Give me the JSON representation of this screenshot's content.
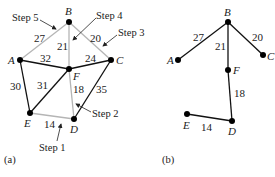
{
  "graph_a": {
    "caption": "(a)",
    "nodes": {
      "A": "A",
      "B": "B",
      "C": "C",
      "D": "D",
      "E": "E",
      "F": "F"
    },
    "edges": [
      {
        "from": "B",
        "to": "A",
        "weight": "27",
        "style": "light"
      },
      {
        "from": "B",
        "to": "F",
        "weight": "21",
        "style": "light"
      },
      {
        "from": "B",
        "to": "C",
        "weight": "20",
        "style": "light"
      },
      {
        "from": "A",
        "to": "F",
        "weight": "32",
        "style": "dark"
      },
      {
        "from": "F",
        "to": "C",
        "weight": "24",
        "style": "dark"
      },
      {
        "from": "A",
        "to": "E",
        "weight": "30",
        "style": "dark"
      },
      {
        "from": "E",
        "to": "F",
        "weight": "31",
        "style": "dark"
      },
      {
        "from": "F",
        "to": "D",
        "weight": "18",
        "style": "light"
      },
      {
        "from": "C",
        "to": "D",
        "weight": "35",
        "style": "dark"
      },
      {
        "from": "E",
        "to": "D",
        "weight": "14",
        "style": "light"
      }
    ],
    "steps": {
      "s1": "Step 1",
      "s2": "Step 2",
      "s3": "Step 3",
      "s4": "Step 4",
      "s5": "Step 5"
    }
  },
  "graph_b": {
    "caption": "(b)",
    "nodes": {
      "A": "A",
      "B": "B",
      "C": "C",
      "D": "D",
      "E": "E",
      "F": "F"
    },
    "edges": [
      {
        "from": "B",
        "to": "A",
        "weight": "27"
      },
      {
        "from": "B",
        "to": "F",
        "weight": "21"
      },
      {
        "from": "B",
        "to": "C",
        "weight": "20"
      },
      {
        "from": "F",
        "to": "D",
        "weight": "18"
      },
      {
        "from": "E",
        "to": "D",
        "weight": "14"
      }
    ]
  },
  "colors": {
    "dark_edge": "#111111",
    "light_edge": "#b5b5b5",
    "node": "#000000"
  }
}
